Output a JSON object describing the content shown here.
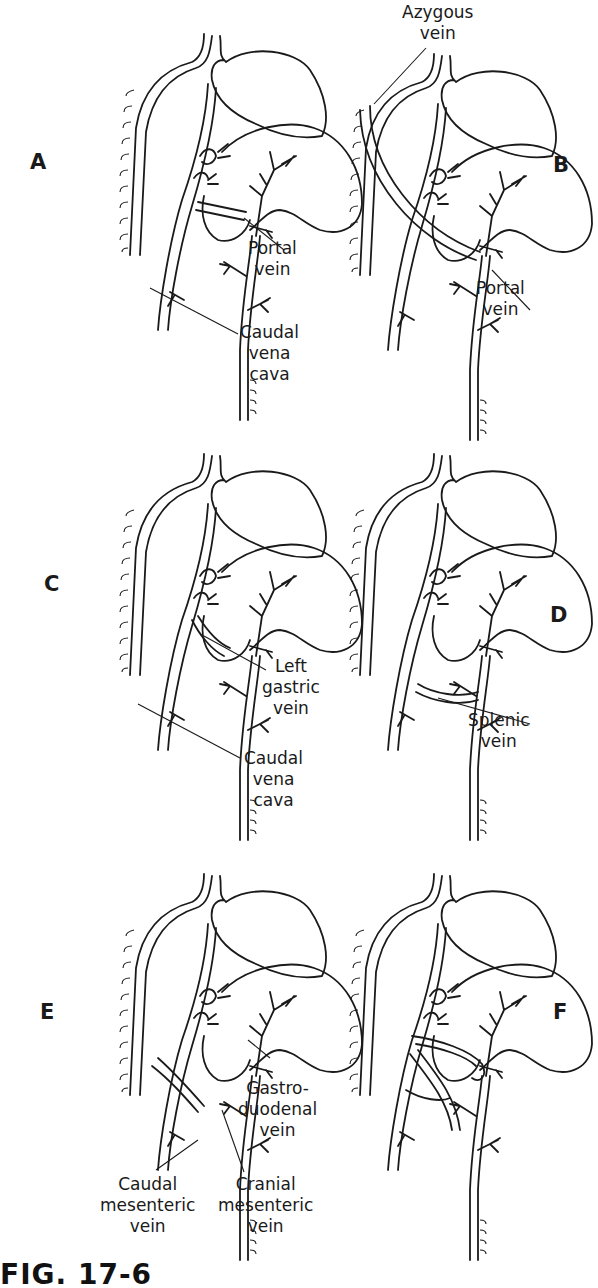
{
  "figure": {
    "caption": "FIG. 17-6",
    "panels": [
      {
        "id": "A",
        "letter": "A",
        "labels": [
          {
            "name": "portal-vein-label",
            "lines": [
              "Portal",
              "vein"
            ]
          },
          {
            "name": "caudal-vena-cava-label",
            "lines": [
              "Caudal",
              "vena",
              "cava"
            ]
          }
        ]
      },
      {
        "id": "B",
        "letter": "B",
        "labels": [
          {
            "name": "azygous-vein-label",
            "lines": [
              "Azygous",
              "vein"
            ]
          },
          {
            "name": "portal-vein-label",
            "lines": [
              "Portal",
              "vein"
            ]
          }
        ]
      },
      {
        "id": "C",
        "letter": "C",
        "labels": [
          {
            "name": "left-gastric-vein-label",
            "lines": [
              "Left",
              "gastric",
              "vein"
            ]
          },
          {
            "name": "caudal-vena-cava-label",
            "lines": [
              "Caudal",
              "vena",
              "cava"
            ]
          }
        ]
      },
      {
        "id": "D",
        "letter": "D",
        "labels": [
          {
            "name": "splenic-vein-label",
            "lines": [
              "Splenic",
              "vein"
            ]
          }
        ]
      },
      {
        "id": "E",
        "letter": "E",
        "labels": [
          {
            "name": "gastroduodenal-vein-label",
            "lines": [
              "Gastro-",
              "duodenal",
              "vein"
            ]
          },
          {
            "name": "caudal-mesenteric-vein-label",
            "lines": [
              "Caudal",
              "mesenteric",
              "vein"
            ]
          },
          {
            "name": "cranial-mesenteric-vein-label",
            "lines": [
              "Cranial",
              "mesenteric",
              "vein"
            ]
          }
        ]
      },
      {
        "id": "F",
        "letter": "F",
        "labels": []
      }
    ]
  }
}
